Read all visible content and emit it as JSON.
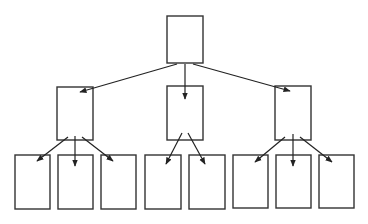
{
  "diagram": {
    "type": "tree",
    "colors": {
      "background": "#ffffff",
      "node_stroke": "#333333",
      "edge_stroke": "#222222"
    },
    "nodes": [
      {
        "id": "root",
        "level": 0,
        "x": 167,
        "y": 16,
        "w": 36,
        "h": 47
      },
      {
        "id": "mid-left",
        "level": 1,
        "x": 57,
        "y": 87,
        "w": 36,
        "h": 53
      },
      {
        "id": "mid-center",
        "level": 1,
        "x": 167,
        "y": 86,
        "w": 36,
        "h": 54
      },
      {
        "id": "mid-right",
        "level": 1,
        "x": 275,
        "y": 86,
        "w": 36,
        "h": 54
      },
      {
        "id": "leaf-1",
        "level": 2,
        "x": 15,
        "y": 155,
        "w": 35,
        "h": 54
      },
      {
        "id": "leaf-2",
        "level": 2,
        "x": 58,
        "y": 155,
        "w": 35,
        "h": 54
      },
      {
        "id": "leaf-3",
        "level": 2,
        "x": 101,
        "y": 155,
        "w": 35,
        "h": 54
      },
      {
        "id": "leaf-4",
        "level": 2,
        "x": 145,
        "y": 155,
        "w": 36,
        "h": 54
      },
      {
        "id": "leaf-5",
        "level": 2,
        "x": 189,
        "y": 155,
        "w": 36,
        "h": 54
      },
      {
        "id": "leaf-6",
        "level": 2,
        "x": 233,
        "y": 155,
        "w": 35,
        "h": 53
      },
      {
        "id": "leaf-7",
        "level": 2,
        "x": 276,
        "y": 155,
        "w": 35,
        "h": 53
      },
      {
        "id": "leaf-8",
        "level": 2,
        "x": 319,
        "y": 155,
        "w": 35,
        "h": 53
      }
    ],
    "edges": [
      {
        "from": "root",
        "to": "mid-left",
        "x1": 177,
        "y1": 64,
        "x2": 80,
        "y2": 92
      },
      {
        "from": "root",
        "to": "mid-center",
        "x1": 185,
        "y1": 64,
        "x2": 185,
        "y2": 99
      },
      {
        "from": "root",
        "to": "mid-right",
        "x1": 193,
        "y1": 64,
        "x2": 290,
        "y2": 91
      },
      {
        "from": "mid-left",
        "to": "leaf-1",
        "x1": 68,
        "y1": 137,
        "x2": 37,
        "y2": 161
      },
      {
        "from": "mid-left",
        "to": "leaf-2",
        "x1": 75,
        "y1": 136,
        "x2": 75,
        "y2": 166
      },
      {
        "from": "mid-left",
        "to": "leaf-3",
        "x1": 82,
        "y1": 137,
        "x2": 113,
        "y2": 161
      },
      {
        "from": "mid-center",
        "to": "leaf-4",
        "x1": 182,
        "y1": 133,
        "x2": 166,
        "y2": 164
      },
      {
        "from": "mid-center",
        "to": "leaf-5",
        "x1": 188,
        "y1": 133,
        "x2": 205,
        "y2": 164
      },
      {
        "from": "mid-right",
        "to": "leaf-6",
        "x1": 285,
        "y1": 137,
        "x2": 255,
        "y2": 162
      },
      {
        "from": "mid-right",
        "to": "leaf-7",
        "x1": 293,
        "y1": 134,
        "x2": 293,
        "y2": 166
      },
      {
        "from": "mid-right",
        "to": "leaf-8",
        "x1": 300,
        "y1": 137,
        "x2": 332,
        "y2": 162
      }
    ]
  }
}
